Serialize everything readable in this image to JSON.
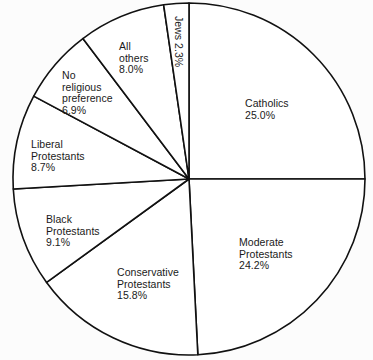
{
  "chart_data": {
    "type": "pie",
    "title": "",
    "subtitle": "",
    "xlabel": "",
    "ylabel": "",
    "legend_position": "none",
    "grid": false,
    "start_angle_deg": 0,
    "direction": "clockwise",
    "units": "percent",
    "categories": [
      "Catholics",
      "Moderate Protestants",
      "Conservative Protestants",
      "Black Protestants",
      "Liberal Protestants",
      "No religious preference",
      "All others",
      "Jews"
    ],
    "values": [
      25.0,
      24.2,
      15.8,
      9.1,
      8.7,
      6.9,
      8.0,
      2.3
    ],
    "slices": [
      {
        "name": "Catholics",
        "label": "Catholics",
        "value": 25.0,
        "value_text": "25.0%",
        "fill": "#ffffff",
        "stroke": "#111111",
        "rotated": false,
        "label_x": 245,
        "label_y": 98,
        "align": "left"
      },
      {
        "name": "Moderate Protestants",
        "label": "Moderate\nProtestants",
        "value": 24.2,
        "value_text": "24.2%",
        "fill": "#ffffff",
        "stroke": "#111111",
        "rotated": false,
        "label_x": 239,
        "label_y": 237,
        "align": "left"
      },
      {
        "name": "Conservative Protestants",
        "label": "Conservative\nProtestants",
        "value": 15.8,
        "value_text": "15.8%",
        "fill": "#ffffff",
        "stroke": "#111111",
        "rotated": false,
        "label_x": 117,
        "label_y": 267,
        "align": "left"
      },
      {
        "name": "Black Protestants",
        "label": "Black\nProtestants",
        "value": 9.1,
        "value_text": "9.1%",
        "fill": "#ffffff",
        "stroke": "#111111",
        "rotated": false,
        "label_x": 46,
        "label_y": 214,
        "align": "left"
      },
      {
        "name": "Liberal Protestants",
        "label": "Liberal\nProtestants",
        "value": 8.7,
        "value_text": "8.7%",
        "fill": "#ffffff",
        "stroke": "#111111",
        "rotated": false,
        "label_x": 31,
        "label_y": 139,
        "align": "left"
      },
      {
        "name": "No religious preference",
        "label": "No\nreligious\npreference",
        "value": 6.9,
        "value_text": "6.9%",
        "fill": "#ffffff",
        "stroke": "#111111",
        "rotated": false,
        "label_x": 62,
        "label_y": 70,
        "align": "left"
      },
      {
        "name": "All others",
        "label": "All\nothers",
        "value": 8.0,
        "value_text": "8.0%",
        "fill": "#ffffff",
        "stroke": "#111111",
        "rotated": false,
        "label_x": 119,
        "label_y": 41,
        "align": "left"
      },
      {
        "name": "Jews",
        "label": "Jews 2.3%",
        "value": 2.3,
        "value_text": "2.3%",
        "fill": "#ffffff",
        "stroke": "#111111",
        "rotated": true,
        "label_x": 184,
        "label_y": 16,
        "align": "left"
      }
    ],
    "geometry": {
      "center_x": 189,
      "center_y": 179,
      "radius": 176
    },
    "style": {
      "background": "#fcfcfc",
      "line_color": "#111111",
      "text_color": "#1a1a1a",
      "slice_fill": "#ffffff"
    }
  }
}
